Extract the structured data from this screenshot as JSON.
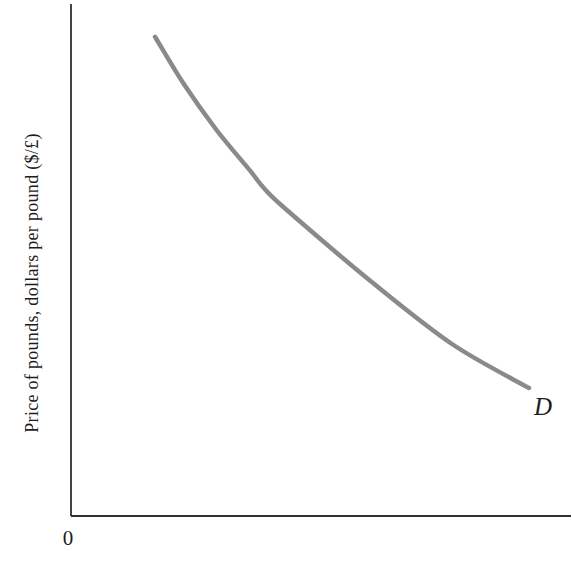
{
  "figure": {
    "background": "#ffffff",
    "axis_color": "#2f2f2f"
  },
  "chart_data": {
    "type": "line",
    "title": "",
    "xlabel": "",
    "ylabel": "Price of pounds, dollars per pound ($/£)",
    "origin_label": "0",
    "axes": {
      "x_ticks": [],
      "y_ticks": [],
      "grid": false,
      "x_range_norm": [
        0,
        1
      ],
      "y_range_norm": [
        0,
        1
      ]
    },
    "series": [
      {
        "name": "demand",
        "label": "D",
        "color": "#8a8a8a",
        "stroke_width": 4.5,
        "points_norm": [
          [
            0.168,
            0.936
          ],
          [
            0.224,
            0.846
          ],
          [
            0.291,
            0.754
          ],
          [
            0.357,
            0.676
          ],
          [
            0.387,
            0.639
          ],
          [
            0.431,
            0.598
          ],
          [
            0.599,
            0.459
          ],
          [
            0.762,
            0.336
          ],
          [
            0.916,
            0.25
          ]
        ]
      }
    ]
  }
}
